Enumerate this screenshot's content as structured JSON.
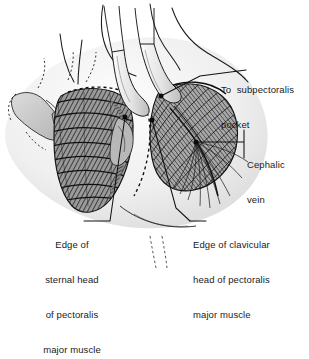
{
  "figure": {
    "kind": "medical-illustration",
    "background_color": "#ffffff",
    "ink_color": "#1a1a1a",
    "skin_tone": "#d8d8d8",
    "muscle_tone": "#8a8a8a",
    "instrument_tone": "#ececec"
  },
  "callouts": {
    "subpectoralis": {
      "line1": "To  subpectoralis",
      "line2": "pocket"
    },
    "cephalic": {
      "line1": "Cephalic",
      "line2": "vein"
    },
    "sternal": {
      "line1": "Edge of",
      "line2": "sternal head",
      "line3": "of pectoralis",
      "line4": "major muscle"
    },
    "clavicular": {
      "line1": "Edge of clavicular",
      "line2": "head of pectoralis",
      "line3": "major muscle"
    }
  }
}
